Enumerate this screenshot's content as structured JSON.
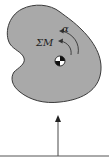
{
  "diagram": {
    "type": "rigid-body free body diagram",
    "labels": {
      "angular_acceleration": "α",
      "sum_of_moments": "ΣM"
    },
    "colors": {
      "body_fill": "#a9a9a9",
      "body_outline": "#3a3a3a",
      "arrow": "#333333",
      "ground_line": "#555555"
    }
  }
}
